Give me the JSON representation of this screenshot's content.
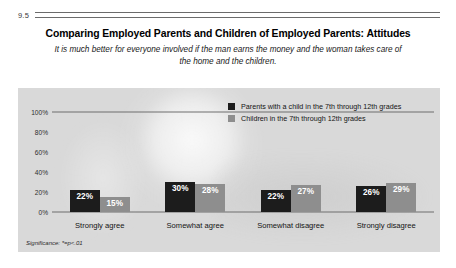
{
  "figure": {
    "number": "9.5",
    "title": "Comparing Employed Parents and Children of Employed Parents: Attitudes",
    "subtitle": "It is much better for everyone involved if the man earns the money and the woman takes care of the home and the children.",
    "footnote": "Significance: *=p<.01"
  },
  "colors": {
    "panel_background": "#d9d9d9",
    "series_parents": "#1c1c1c",
    "series_children": "#8e8e8e",
    "axis_line": "#6f6f6f",
    "value_label": "#ffffff"
  },
  "legend": {
    "position": "top-right-inside",
    "entries": [
      {
        "label": "Parents with a child in the 7th through 12th grades",
        "color": "#1c1c1c"
      },
      {
        "label": "Children in the 7th through 12th grades",
        "color": "#8e8e8e"
      }
    ]
  },
  "axis": {
    "y_ticks": [
      "100%",
      "80%",
      "60%",
      "40%",
      "20%",
      "0%"
    ]
  },
  "chart_data": {
    "type": "bar",
    "title": "Comparing Employed Parents and Children of Employed Parents: Attitudes",
    "subtitle": "It is much better for everyone involved if the man earns the money and the woman takes care of the home and the children.",
    "xlabel": "",
    "ylabel": "",
    "ylim": [
      0,
      100
    ],
    "ytick_values": [
      0,
      20,
      40,
      60,
      80,
      100
    ],
    "ytick_labels": [
      "0%",
      "20%",
      "40%",
      "60%",
      "80%",
      "100%"
    ],
    "grid": false,
    "legend_position": "upper right",
    "categories": [
      "Strongly agree",
      "Somewhat agree",
      "Somewhat disagree",
      "Strongly disagree"
    ],
    "series": [
      {
        "name": "Parents with a child in the 7th through 12th grades",
        "color": "#1c1c1c",
        "values": [
          22,
          30,
          22,
          26
        ],
        "value_labels": [
          "22%",
          "30%",
          "22%",
          "26%"
        ]
      },
      {
        "name": "Children in the 7th through 12th grades",
        "color": "#8e8e8e",
        "values": [
          15,
          28,
          27,
          29
        ],
        "value_labels": [
          "15%",
          "28%",
          "27%",
          "29%"
        ]
      }
    ],
    "annotations": [
      "Significance: *=p<.01"
    ]
  }
}
